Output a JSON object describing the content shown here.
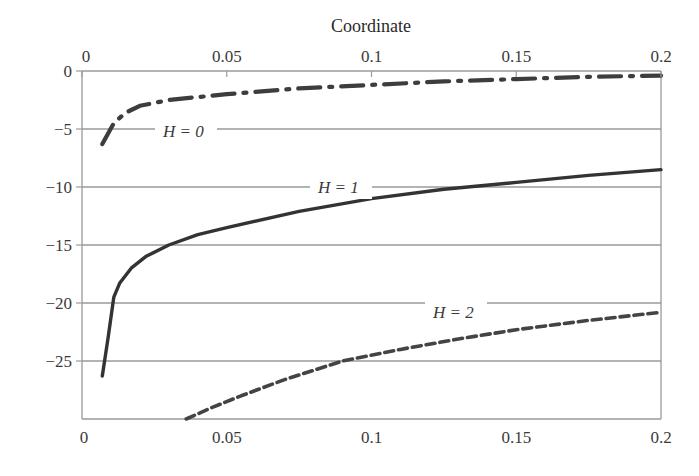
{
  "chart_data": {
    "type": "line",
    "title": "Coordinate",
    "xlabel": "Coordinate",
    "ylabel": "",
    "xlim": [
      0,
      0.2
    ],
    "ylim": [
      -30,
      0
    ],
    "x_ticks_top": [
      "0",
      "0.05",
      "0.1",
      "0.15",
      "0.2"
    ],
    "x_ticks_bottom": [
      "0",
      "0.05",
      "0.1",
      "0.15",
      "0.2"
    ],
    "y_ticks": [
      "0",
      "-5",
      "-10",
      "-15",
      "-20",
      "-25"
    ],
    "grid": "horizontal",
    "series": [
      {
        "name": "H = 0",
        "style": "dash-dot",
        "x": [
          0.007,
          0.009,
          0.011,
          0.015,
          0.02,
          0.03,
          0.05,
          0.075,
          0.1,
          0.125,
          0.15,
          0.175,
          0.2
        ],
        "y": [
          -6.3,
          -5.4,
          -4.5,
          -3.6,
          -3.0,
          -2.5,
          -2.0,
          -1.5,
          -1.2,
          -0.9,
          -0.7,
          -0.5,
          -0.4
        ]
      },
      {
        "name": "H = 1",
        "style": "solid",
        "x": [
          0.007,
          0.009,
          0.011,
          0.013,
          0.017,
          0.022,
          0.03,
          0.04,
          0.05,
          0.075,
          0.1,
          0.125,
          0.15,
          0.175,
          0.2
        ],
        "y": [
          -26.3,
          -23.0,
          -19.5,
          -18.3,
          -17.0,
          -16.0,
          -15.0,
          -14.1,
          -13.5,
          -12.1,
          -11.0,
          -10.2,
          -9.6,
          -9.0,
          -8.5
        ]
      },
      {
        "name": "H = 2",
        "style": "dashed",
        "x": [
          0.036,
          0.045,
          0.055,
          0.07,
          0.09,
          0.11,
          0.13,
          0.15,
          0.175,
          0.2
        ],
        "y": [
          -30.0,
          -29.0,
          -28.0,
          -26.6,
          -25.0,
          -24.0,
          -23.1,
          -22.3,
          -21.5,
          -20.8
        ]
      }
    ],
    "annotations": [
      {
        "text": "H = 0",
        "x": 0.03,
        "y": -5.2
      },
      {
        "text": "H = 1",
        "x": 0.085,
        "y": -9.9
      },
      {
        "text": "H = 2",
        "x": 0.135,
        "y": -21.1
      }
    ]
  },
  "labels": {
    "title": "Coordinate",
    "h0": "H = 0",
    "h1": "H = 1",
    "h2": "H = 2"
  }
}
